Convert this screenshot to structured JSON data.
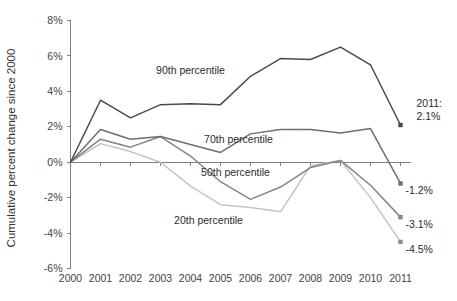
{
  "chart_data": {
    "type": "line",
    "title": "",
    "xlabel": "",
    "ylabel": "Cumulative percent change since 2000",
    "x": [
      2000,
      2001,
      2002,
      2003,
      2004,
      2005,
      2006,
      2007,
      2008,
      2009,
      2010,
      2011
    ],
    "xlim": [
      2000,
      2011
    ],
    "ylim": [
      -6,
      8
    ],
    "ytick_labels": [
      "8%",
      "6%",
      "4%",
      "2%",
      "0%",
      "-2%",
      "-4%",
      "-6%"
    ],
    "ytick_values": [
      8,
      6,
      4,
      2,
      0,
      -2,
      -4,
      -6
    ],
    "xtick_labels": [
      "2000",
      "2001",
      "2002",
      "2003",
      "2004",
      "2005",
      "2006",
      "2007",
      "2008",
      "2009",
      "2010",
      "2011"
    ],
    "grid": false,
    "legend_position": "inline-labels",
    "series": [
      {
        "name": "90th percentile",
        "color": "#4a4a4a",
        "label": "90th percentile",
        "end_label": "2011:\n2.1%",
        "end_value_text": "2.1%",
        "end_year_text": "2011:",
        "values": [
          0.0,
          3.5,
          2.5,
          3.25,
          3.3,
          3.25,
          4.85,
          5.85,
          5.8,
          6.5,
          5.5,
          2.1
        ]
      },
      {
        "name": "70th percentile",
        "color": "#6e6e6e",
        "label": "70th percentile",
        "end_label": "-1.2%",
        "end_value_text": "-1.2%",
        "values": [
          0.0,
          1.85,
          1.3,
          1.45,
          1.0,
          0.55,
          1.6,
          1.85,
          1.85,
          1.65,
          1.9,
          -1.2
        ]
      },
      {
        "name": "50th percentile",
        "color": "#858585",
        "label": "50th percentile",
        "end_label": "-3.1%",
        "end_value_text": "-3.1%",
        "values": [
          0.0,
          1.3,
          0.85,
          1.45,
          0.35,
          -1.1,
          -2.1,
          -1.4,
          -0.3,
          0.1,
          -1.3,
          -3.1
        ]
      },
      {
        "name": "20th percentile",
        "color": "#c4c4c4",
        "label": "20th percentile",
        "end_label": "-4.5%",
        "end_value_text": "-4.5%",
        "values": [
          0.0,
          1.05,
          0.6,
          0.0,
          -1.35,
          -2.4,
          -2.55,
          -2.8,
          -0.2,
          0.1,
          -2.0,
          -4.5
        ]
      }
    ],
    "annotations": [
      {
        "text": "90th percentile",
        "x": 2004.0,
        "y": 5.0
      },
      {
        "text": "70th percentile",
        "x": 2005.6,
        "y": 1.1
      },
      {
        "text": "50th percentile",
        "x": 2005.5,
        "y": -0.75
      },
      {
        "text": "20th percentile",
        "x": 2004.6,
        "y": -3.5
      }
    ]
  }
}
